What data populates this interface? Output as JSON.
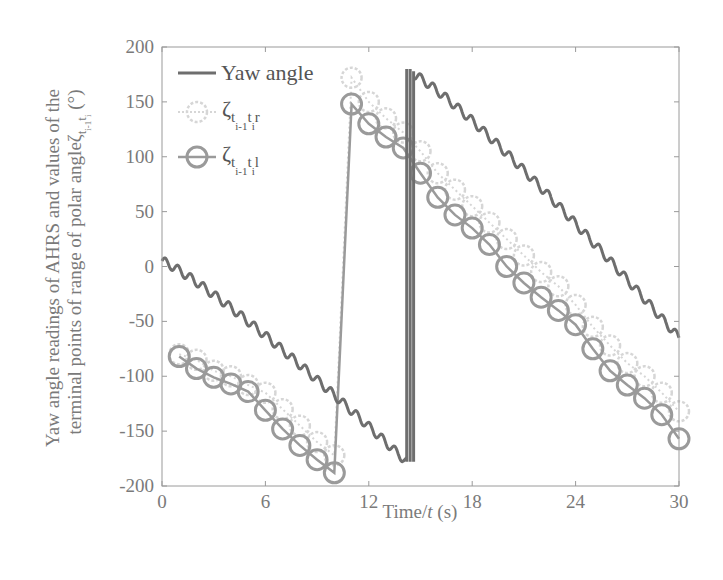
{
  "chart_data": {
    "type": "line",
    "title": "",
    "xlabel": "Time/t (s)",
    "ylabel_line1": "Yaw angle readings of AHRS and values of the",
    "ylabel_line2": "terminal points of range of polar angle ζ(t_{i-1} t_i) (°)",
    "xlim": [
      0,
      30
    ],
    "ylim": [
      -200,
      200
    ],
    "xticks": [
      0,
      6,
      12,
      18,
      24,
      30
    ],
    "yticks": [
      200,
      150,
      100,
      50,
      0,
      -50,
      -100,
      -150,
      -200
    ],
    "grid": false,
    "legend_position": "upper left",
    "colors": {
      "yaw": "#6e6e6e",
      "r": "#d6d6d6",
      "l": "#9a9a9a",
      "axis": "#9a9a9a"
    },
    "series": [
      {
        "name": "Yaw angle",
        "style": "line (oscillating)",
        "segments": [
          {
            "t": [
              0,
              14.2
            ],
            "v": [
              5,
              -178
            ]
          },
          {
            "t": [
              14.2,
              14.2
            ],
            "v": [
              -178,
              180
            ]
          },
          {
            "t": [
              14.4,
              14.4
            ],
            "v": [
              180,
              -178
            ]
          },
          {
            "t": [
              14.6,
              14.6
            ],
            "v": [
              -178,
              178
            ]
          },
          {
            "t": [
              14.6,
              30
            ],
            "v": [
              175,
              -65
            ]
          }
        ]
      },
      {
        "name": "ζ t(i-1) t(i) r",
        "style": "light dotted circles",
        "t": [
          1,
          2,
          3,
          4,
          5,
          6,
          7,
          8,
          9,
          10,
          11,
          12,
          13,
          14,
          15,
          16,
          17,
          18,
          19,
          20,
          21,
          22,
          23,
          24,
          25,
          26,
          27,
          28,
          29,
          30
        ],
        "values": [
          -80,
          -85,
          -95,
          -100,
          -108,
          -115,
          -130,
          -145,
          -160,
          -172,
          172,
          150,
          135,
          122,
          105,
          85,
          70,
          55,
          40,
          25,
          10,
          -5,
          -18,
          -35,
          -55,
          -72,
          -88,
          -100,
          -115,
          -132
        ]
      },
      {
        "name": "ζ t(i-1) t(i) l",
        "style": "solid line with circles",
        "t": [
          1,
          2,
          3,
          4,
          5,
          6,
          7,
          8,
          9,
          10,
          11,
          12,
          13,
          14,
          15,
          16,
          17,
          18,
          19,
          20,
          21,
          22,
          23,
          24,
          25,
          26,
          27,
          28,
          29,
          30
        ],
        "values": [
          -82,
          -93,
          -101,
          -107,
          -114,
          -131,
          -148,
          -163,
          -176,
          -188,
          148,
          130,
          118,
          108,
          85,
          63,
          47,
          35,
          20,
          0,
          -15,
          -28,
          -40,
          -53,
          -75,
          -95,
          -108,
          -120,
          -135,
          -157
        ]
      }
    ]
  },
  "legend": {
    "yaw_label": "Yaw angle",
    "r_symbol": "ζ",
    "r_sub": "t",
    "r_subsub1": "i-1",
    "r_mid": "t",
    "r_subsub2": "i",
    "r_suffix": "r",
    "l_symbol": "ζ",
    "l_sub": "t",
    "l_subsub1": "i-1",
    "l_mid": "t",
    "l_subsub2": "i",
    "l_suffix": "l"
  },
  "axes": {
    "xlabel_prefix": "Time/",
    "xlabel_var": "t",
    "xlabel_suffix": " (s)",
    "ylabel_line1": "Yaw angle readings of AHRS and values of the",
    "ylabel_line2": "terminal points of range of polar angle",
    "ylabel_symbol": "ζ",
    "ylabel_sub": "t",
    "ylabel_subsub1": "i-1",
    "ylabel_mid": "t",
    "ylabel_subsub2": "i",
    "ylabel_unit": " (°)"
  }
}
